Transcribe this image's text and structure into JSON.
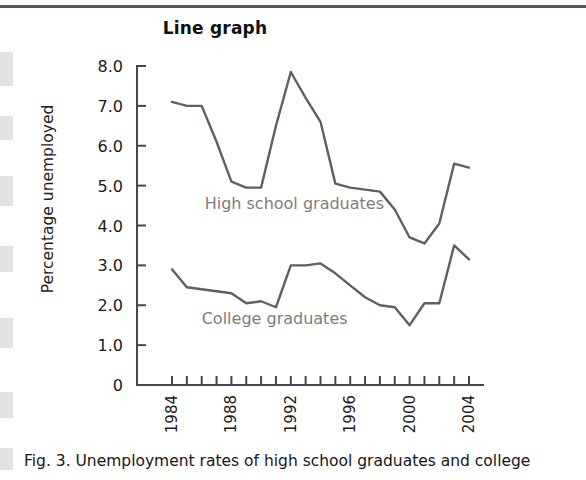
{
  "page": {
    "figure_title": "Line graph",
    "caption": "Fig. 3. Unemployment rates of high school graduates and college"
  },
  "chart_data": {
    "type": "line",
    "title": "Line graph",
    "xlabel": "",
    "ylabel": "Percentage unemployed",
    "xlim": [
      1984,
      2004
    ],
    "ylim": [
      0,
      8
    ],
    "grid": false,
    "legend_position": "inline-annotation",
    "y_ticks": [
      "0",
      "1.0",
      "2.0",
      "3.0",
      "4.0",
      "5.0",
      "6.0",
      "7.0",
      "8.0"
    ],
    "y_tick_values": [
      0,
      1,
      2,
      3,
      4,
      5,
      6,
      7,
      8
    ],
    "x_ticks_all": [
      1984,
      1985,
      1986,
      1987,
      1988,
      1989,
      1990,
      1991,
      1992,
      1993,
      1994,
      1995,
      1996,
      1997,
      1998,
      1999,
      2000,
      2001,
      2002,
      2003,
      2004
    ],
    "x_tick_labels": [
      "1984",
      "1988",
      "1992",
      "1996",
      "2000",
      "2004"
    ],
    "x_tick_label_values": [
      1984,
      1988,
      1992,
      1996,
      2000,
      2004
    ],
    "x": [
      1984,
      1985,
      1986,
      1987,
      1988,
      1989,
      1990,
      1991,
      1992,
      1993,
      1994,
      1995,
      1996,
      1997,
      1998,
      1999,
      2000,
      2001,
      2002,
      2003,
      2004
    ],
    "series": [
      {
        "name": "High school graduates",
        "color": "#5b6166",
        "label_x": 1986.2,
        "label_y": 4.42,
        "values": [
          7.1,
          7.0,
          7.0,
          6.1,
          5.1,
          4.95,
          4.95,
          6.5,
          7.85,
          7.2,
          6.6,
          5.05,
          4.95,
          4.9,
          4.85,
          4.4,
          3.7,
          3.55,
          4.05,
          5.55,
          5.45
        ]
      },
      {
        "name": "College graduates",
        "color": "#5b6166",
        "label_x": 1986.0,
        "label_y": 1.52,
        "values": [
          2.9,
          2.45,
          2.4,
          2.35,
          2.3,
          2.05,
          2.1,
          1.95,
          3.0,
          3.0,
          3.05,
          2.8,
          2.5,
          2.2,
          2.0,
          1.95,
          1.5,
          2.05,
          2.05,
          3.5,
          3.15
        ]
      }
    ]
  }
}
